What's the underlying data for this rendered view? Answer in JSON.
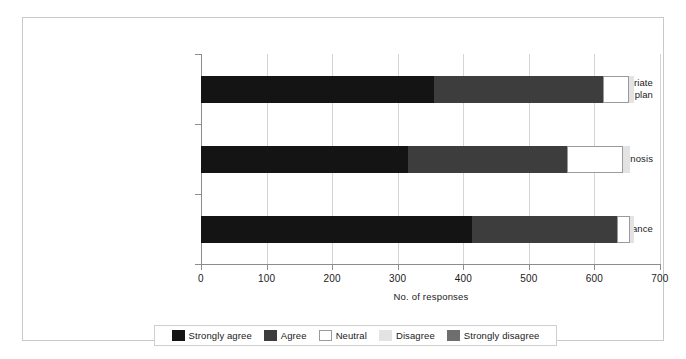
{
  "chart_data": {
    "type": "bar",
    "orientation": "horizontal",
    "stacked": true,
    "title": "",
    "xlabel": "No. of responses",
    "ylabel": "",
    "xlim": [
      0,
      700
    ],
    "xticks": [
      0,
      100,
      200,
      300,
      400,
      500,
      600,
      700
    ],
    "xticklabels": [
      "0",
      "100",
      "200",
      "300",
      "400",
      "500",
      "600",
      "700"
    ],
    "grid": true,
    "grid_axis": "x",
    "legend_position": "bottom",
    "categories": [
      "Formulation of an appropriate treatment plan",
      "Accuracy of diagnosis",
      "Therapeutic alliance"
    ],
    "category_label_lines": [
      [
        "Formulation of an appropriate",
        "treatment plan"
      ],
      [
        "Accuracy of diagnosis"
      ],
      [
        "Therapeutic alliance"
      ]
    ],
    "series": [
      {
        "name": "Strongly agree",
        "color": "#141414",
        "values": [
          355,
          315,
          413
        ]
      },
      {
        "name": "Agree",
        "color": "#3d3d3d",
        "values": [
          258,
          243,
          222
        ]
      },
      {
        "name": "Neutral",
        "color": "#ffffff",
        "values": [
          40,
          85,
          20
        ]
      },
      {
        "name": "Disagree",
        "color": "#e3e3e3",
        "values": [
          8,
          12,
          6
        ]
      },
      {
        "name": "Strongly disagree",
        "color": "#6e6e6e",
        "values": [
          0,
          0,
          0
        ]
      }
    ],
    "totals": [
      661,
      655,
      661
    ]
  },
  "legend": {
    "items": [
      {
        "label": "Strongly agree",
        "color": "#141414",
        "bordered": false
      },
      {
        "label": "Agree",
        "color": "#3d3d3d",
        "bordered": false
      },
      {
        "label": "Neutral",
        "color": "#ffffff",
        "bordered": true
      },
      {
        "label": "Disagree",
        "color": "#e3e3e3",
        "bordered": false
      },
      {
        "label": "Strongly disagree",
        "color": "#6e6e6e",
        "bordered": false
      }
    ]
  }
}
